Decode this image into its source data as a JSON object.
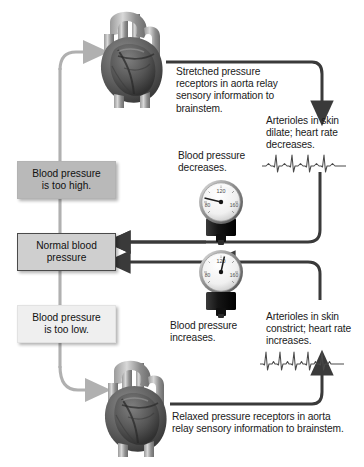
{
  "diagram": {
    "state_boxes": [
      {
        "id": "too-high",
        "line1": "Blood pressure",
        "line2": "is too high.",
        "style": "high"
      },
      {
        "id": "normal",
        "line1": "Normal blood",
        "line2": "pressure",
        "style": "normal"
      },
      {
        "id": "too-low",
        "line1": "Blood pressure",
        "line2": "is too low.",
        "style": "low"
      }
    ],
    "labels": {
      "stretched_receptors": "Stretched pressure receptors in aorta relay sensory information to brainstem.",
      "arterioles_dilate": "Arterioles in skin dilate; heart rate decreases.",
      "bp_decreases": "Blood pressure decreases.",
      "bp_increases": "Blood pressure increases.",
      "arterioles_constrict": "Arterioles in skin constrict; heart rate increases.",
      "relaxed_receptors": "Relaxed pressure receptors in aorta relay sensory information to brainstem."
    },
    "gauges": [
      {
        "id": "gauge-decreasing",
        "top_value": "120",
        "left_value": "80",
        "right_value": "160",
        "needle_direction": "left",
        "meaning": "decreasing"
      },
      {
        "id": "gauge-increasing",
        "top_value": "120",
        "left_value": "80",
        "right_value": "160",
        "needle_direction": "right",
        "meaning": "increasing"
      }
    ],
    "ecg": [
      {
        "id": "ecg-slow",
        "beats": 4,
        "rate": "slow"
      },
      {
        "id": "ecg-fast",
        "beats": 5,
        "rate": "fast"
      }
    ],
    "hearts": [
      {
        "id": "heart-top",
        "state": "stretched aorta"
      },
      {
        "id": "heart-bottom",
        "state": "relaxed aorta"
      }
    ],
    "colors": {
      "stimulus_path": "#b0b0b0",
      "response_path": "#3a3a3a",
      "box_high": "#b9b9b9",
      "box_normal": "#cfcfcf",
      "box_low": "#efefef",
      "text": "#1a1a1a"
    }
  }
}
